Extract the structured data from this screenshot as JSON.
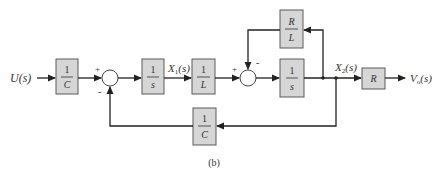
{
  "diagram": {
    "type": "block-diagram",
    "caption": "(b)",
    "input": {
      "label": "U(s)"
    },
    "output": {
      "label": "Vo(s)",
      "main": "V",
      "sub": "o",
      "tail": "(s)"
    },
    "blocks": [
      {
        "id": "b1",
        "num": "1",
        "den": "C"
      },
      {
        "id": "b2",
        "num": "1",
        "den": "s"
      },
      {
        "id": "b3",
        "num": "1",
        "den": "L"
      },
      {
        "id": "b4",
        "num": "1",
        "den": "s"
      },
      {
        "id": "b5",
        "num": "R",
        "den": "L"
      },
      {
        "id": "b6",
        "label": "R"
      },
      {
        "id": "b7",
        "num": "1",
        "den": "C"
      }
    ],
    "signals": [
      {
        "id": "x1",
        "main": "X",
        "sub": "1",
        "tail": "(s)"
      },
      {
        "id": "x2",
        "main": "X",
        "sub": "2",
        "tail": "(s)"
      }
    ],
    "junctions": [
      {
        "id": "sum1",
        "signs": {
          "top_left": "+",
          "bottom_left": "-"
        }
      },
      {
        "id": "sum2",
        "signs": {
          "top_left": "+",
          "top_right": "-"
        }
      }
    ]
  }
}
